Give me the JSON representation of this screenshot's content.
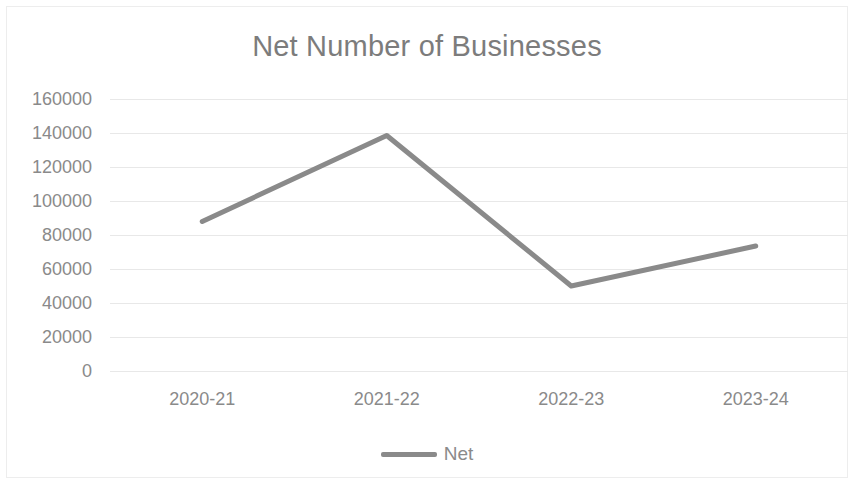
{
  "chart_data": {
    "type": "line",
    "title": "Net Number of Businesses",
    "xlabel": "",
    "ylabel": "",
    "categories": [
      "2020-21",
      "2021-22",
      "2022-23",
      "2023-24"
    ],
    "series": [
      {
        "name": "Net",
        "values": [
          88000,
          138500,
          50000,
          73500
        ]
      }
    ],
    "ylim": [
      0,
      160000
    ],
    "ytick_labels": [
      "160000",
      "140000",
      "120000",
      "100000",
      "80000",
      "60000",
      "40000",
      "20000",
      "0"
    ],
    "ytick_values": [
      160000,
      140000,
      120000,
      100000,
      80000,
      60000,
      40000,
      20000,
      0
    ],
    "grid": true,
    "grid_axis": "y",
    "legend": true,
    "legend_position": "bottom",
    "colors": {
      "series_net": "#8a8a8a",
      "gridline": "#e8e8e8",
      "text": "#8a8a8a",
      "title_text": "#7c7c7c",
      "background": "#ffffff",
      "frame": "#ededed"
    }
  },
  "legend": {
    "entries": [
      {
        "label": "Net",
        "color": "#8a8a8a"
      }
    ]
  }
}
